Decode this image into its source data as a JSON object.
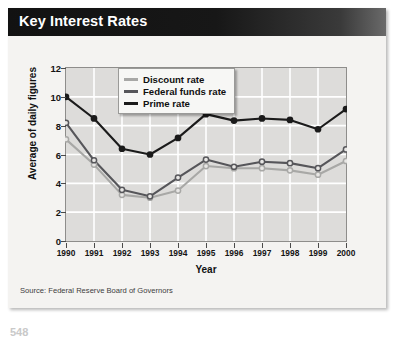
{
  "header": {
    "title": "Key Interest Rates"
  },
  "footer": {
    "source": "Source: Federal Reserve Board of Governors",
    "page_number": "548"
  },
  "chart_data": {
    "type": "line",
    "title": "Key Interest Rates",
    "xlabel": "Year",
    "ylabel": "Average of daily figures",
    "categories": [
      "1990",
      "1991",
      "1992",
      "1993",
      "1994",
      "1995",
      "1996",
      "1997",
      "1998",
      "1999",
      "2000"
    ],
    "x": [
      1990,
      1991,
      1992,
      1993,
      1994,
      1995,
      1996,
      1997,
      1998,
      1999,
      2000
    ],
    "xlim": [
      1990,
      2000
    ],
    "ylim": [
      0,
      12
    ],
    "yticks": [
      0,
      2,
      4,
      6,
      8,
      10,
      12
    ],
    "grid": true,
    "legend_position": "top-left-inside",
    "series": [
      {
        "name": "Discount rate",
        "color": "#a8a8a6",
        "marker": "open-circle",
        "values": [
          7.05,
          5.3,
          3.2,
          3.0,
          3.5,
          5.2,
          5.05,
          5.05,
          4.9,
          4.6,
          5.55
        ]
      },
      {
        "name": "Federal funds rate",
        "color": "#56565a",
        "marker": "open-circle",
        "values": [
          8.2,
          5.6,
          3.55,
          3.1,
          4.4,
          5.65,
          5.15,
          5.5,
          5.4,
          5.05,
          6.35
        ]
      },
      {
        "name": "Prime rate",
        "color": "#1b1b1b",
        "marker": "filled-circle",
        "values": [
          10.0,
          8.5,
          6.4,
          6.0,
          7.15,
          8.8,
          8.35,
          8.5,
          8.4,
          7.75,
          9.15
        ]
      }
    ]
  }
}
